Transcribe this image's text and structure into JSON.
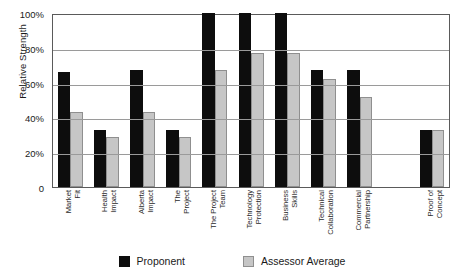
{
  "chart_data": {
    "type": "bar",
    "title": "",
    "xlabel": "",
    "ylabel": "Relative Strength",
    "ylim": [
      0,
      100
    ],
    "grid": true,
    "legend_position": "bottom",
    "y_tick_labels": [
      "100%",
      "80%",
      "60%",
      "40%",
      "20%",
      "0"
    ],
    "y_tick_values": [
      100,
      80,
      60,
      40,
      20,
      0
    ],
    "categories": [
      "Market Fit",
      "Health Impact",
      "Alberta Impact",
      "The Project",
      "The Project Team",
      "Technology Protection",
      "Business Skills",
      "Technical Collaboration",
      "Commercial Partnership",
      "Proof of Concept"
    ],
    "category_lines": [
      [
        "Market",
        "Fit"
      ],
      [
        "Health",
        "Impact"
      ],
      [
        "Alberta",
        "Impact"
      ],
      [
        "The",
        "Project"
      ],
      [
        "The Project",
        "Team"
      ],
      [
        "Technology",
        "Protection"
      ],
      [
        "Business",
        "Skills"
      ],
      [
        "Technical",
        "Collaboration"
      ],
      [
        "Commercial",
        "Partnership"
      ],
      [
        "Proof of",
        "Concept"
      ]
    ],
    "series": [
      {
        "name": "Proponent",
        "color": "#0d0d0d",
        "values": [
          66,
          33,
          67,
          33,
          100,
          100,
          100,
          67,
          67,
          33
        ]
      },
      {
        "name": "Assessor Average",
        "color": "#c6c6c6",
        "values": [
          43,
          29,
          43,
          29,
          67,
          77,
          77,
          62,
          52,
          33
        ]
      }
    ]
  },
  "legend": {
    "items": [
      {
        "label": "Proponent",
        "swatch": "black-square-icon"
      },
      {
        "label": "Assessor Average",
        "swatch": "gray-square-icon"
      }
    ]
  }
}
